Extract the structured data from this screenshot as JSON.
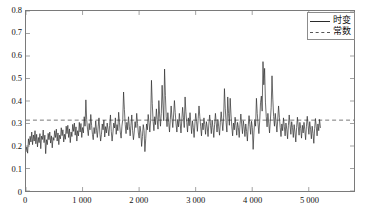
{
  "chart_data": {
    "type": "line",
    "title": "",
    "xlabel": "",
    "ylabel": "",
    "xlim": [
      0,
      5800
    ],
    "ylim": [
      0,
      0.8
    ],
    "grid": false,
    "legend_position": "top-right",
    "xticks": [
      0,
      1000,
      2000,
      3000,
      4000,
      5000
    ],
    "xtick_labels": [
      "0",
      "1 000",
      "2 000",
      "3 000",
      "4 000",
      "5 000"
    ],
    "yticks": [
      0,
      0.1,
      0.2,
      0.3,
      0.4,
      0.5,
      0.6,
      0.7,
      0.8
    ],
    "ytick_labels": [
      "0",
      "0.1",
      "0.2",
      "0.3",
      "0.4",
      "0.5",
      "0.6",
      "0.7",
      "0.8"
    ],
    "series": [
      {
        "name": "时变",
        "style": "solid",
        "color": "#2b2b2b",
        "x_start": 0,
        "x_step": 14.5,
        "values": [
          0.175,
          0.196,
          0.168,
          0.232,
          0.205,
          0.243,
          0.218,
          0.262,
          0.206,
          0.249,
          0.222,
          0.268,
          0.21,
          0.252,
          0.196,
          0.238,
          0.215,
          0.255,
          0.188,
          0.244,
          0.229,
          0.271,
          0.215,
          0.248,
          0.166,
          0.228,
          0.206,
          0.256,
          0.228,
          0.262,
          0.213,
          0.245,
          0.192,
          0.238,
          0.225,
          0.268,
          0.238,
          0.275,
          0.222,
          0.258,
          0.206,
          0.248,
          0.232,
          0.281,
          0.246,
          0.272,
          0.218,
          0.252,
          0.23,
          0.288,
          0.255,
          0.292,
          0.238,
          0.276,
          0.215,
          0.262,
          0.242,
          0.296,
          0.265,
          0.302,
          0.248,
          0.285,
          0.222,
          0.268,
          0.245,
          0.305,
          0.262,
          0.3,
          0.238,
          0.282,
          0.258,
          0.33,
          0.288,
          0.405,
          0.318,
          0.275,
          0.246,
          0.3,
          0.272,
          0.34,
          0.292,
          0.252,
          0.228,
          0.282,
          0.255,
          0.312,
          0.27,
          0.238,
          0.285,
          0.325,
          0.262,
          0.222,
          0.252,
          0.298,
          0.272,
          0.315,
          0.24,
          0.286,
          0.258,
          0.302,
          0.275,
          0.245,
          0.292,
          0.338,
          0.265,
          0.222,
          0.258,
          0.302,
          0.28,
          0.325,
          0.252,
          0.295,
          0.268,
          0.35,
          0.305,
          0.262,
          0.235,
          0.288,
          0.318,
          0.44,
          0.362,
          0.295,
          0.255,
          0.305,
          0.272,
          0.33,
          0.288,
          0.245,
          0.292,
          0.338,
          0.268,
          0.228,
          0.262,
          0.308,
          0.282,
          0.345,
          0.3,
          0.258,
          0.235,
          0.288,
          0.262,
          0.198,
          0.242,
          0.295,
          0.268,
          0.175,
          0.232,
          0.298,
          0.272,
          0.34,
          0.305,
          0.262,
          0.315,
          0.492,
          0.388,
          0.31,
          0.268,
          0.33,
          0.295,
          0.365,
          0.318,
          0.275,
          0.402,
          0.338,
          0.288,
          0.345,
          0.47,
          0.382,
          0.312,
          0.542,
          0.425,
          0.33,
          0.286,
          0.348,
          0.305,
          0.262,
          0.318,
          0.378,
          0.325,
          0.282,
          0.338,
          0.402,
          0.348,
          0.298,
          0.262,
          0.318,
          0.285,
          0.345,
          0.302,
          0.258,
          0.315,
          0.372,
          0.325,
          0.282,
          0.418,
          0.352,
          0.305,
          0.262,
          0.325,
          0.29,
          0.348,
          0.302,
          0.255,
          0.312,
          0.282,
          0.238,
          0.298,
          0.345,
          0.308,
          0.265,
          0.322,
          0.378,
          0.33,
          0.288,
          0.245,
          0.302,
          0.272,
          0.325,
          0.295,
          0.252,
          0.308,
          0.285,
          0.242,
          0.298,
          0.338,
          0.292,
          0.255,
          0.315,
          0.282,
          0.238,
          0.295,
          0.345,
          0.302,
          0.262,
          0.318,
          0.285,
          0.248,
          0.305,
          0.352,
          0.31,
          0.268,
          0.325,
          0.455,
          0.368,
          0.305,
          0.262,
          0.418,
          0.345,
          0.292,
          0.412,
          0.338,
          0.285,
          0.245,
          0.302,
          0.272,
          0.328,
          0.292,
          0.248,
          0.305,
          0.282,
          0.238,
          0.295,
          0.342,
          0.298,
          0.255,
          0.312,
          0.285,
          0.242,
          0.298,
          0.265,
          0.222,
          0.288,
          0.335,
          0.295,
          0.252,
          0.31,
          0.282,
          0.185,
          0.262,
          0.318,
          0.288,
          0.412,
          0.345,
          0.298,
          0.255,
          0.312,
          0.392,
          0.422,
          0.355,
          0.575,
          0.472,
          0.545,
          0.395,
          0.33,
          0.285,
          0.345,
          0.302,
          0.258,
          0.315,
          0.372,
          0.512,
          0.408,
          0.332,
          0.288,
          0.345,
          0.302,
          0.262,
          0.318,
          0.378,
          0.328,
          0.282,
          0.242,
          0.298,
          0.268,
          0.325,
          0.288,
          0.245,
          0.302,
          0.275,
          0.232,
          0.292,
          0.338,
          0.295,
          0.252,
          0.308,
          0.282,
          0.238,
          0.295,
          0.262,
          0.218,
          0.282,
          0.328,
          0.288,
          0.248,
          0.305,
          0.278,
          0.235,
          0.292,
          0.258,
          0.305,
          0.272,
          0.228,
          0.288,
          0.332,
          0.292,
          0.252,
          0.308,
          0.275,
          0.232,
          0.288,
          0.255,
          0.212,
          0.278,
          0.322,
          0.285,
          0.245,
          0.298,
          0.268,
          0.318,
          0.282
        ]
      },
      {
        "name": "常数",
        "style": "dashed",
        "color": "#555555",
        "constant_value": 0.315
      }
    ]
  },
  "legend": {
    "items": [
      {
        "label": "时变",
        "style": "solid"
      },
      {
        "label": "常数",
        "style": "dashed"
      }
    ]
  }
}
